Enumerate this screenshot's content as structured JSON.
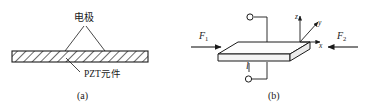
{
  "figure": {
    "panels": [
      {
        "id": "a",
        "caption": "(a)",
        "labels": {
          "electrode": "电极",
          "element": "PZT元件"
        }
      },
      {
        "id": "b",
        "caption": "(b)",
        "labels": {
          "force_left": "F",
          "force_left_sub": "1",
          "force_right": "F",
          "force_right_sub": "2",
          "length": "l",
          "axis_x": "x",
          "axis_y": "y",
          "axis_z": "z"
        }
      }
    ]
  },
  "colors": {
    "stroke": "#1a1a1a",
    "hatch": "#3a3a3a",
    "fill": "#ffffff",
    "plate_top": "#fdfdfd",
    "plate_side": "#f2f2f2",
    "background": "#ffffff"
  }
}
